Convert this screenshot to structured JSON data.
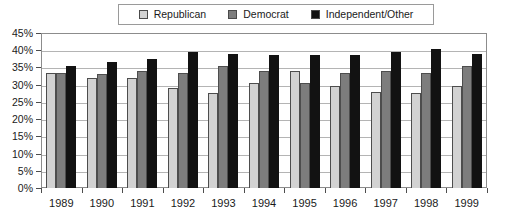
{
  "chart_data": {
    "type": "bar",
    "title": "",
    "xlabel": "",
    "ylabel": "",
    "ylim": [
      0,
      45
    ],
    "ytick_step": 5,
    "grid": true,
    "legend_position": "top-center",
    "yticks": [
      "45%",
      "40%",
      "35%",
      "30%",
      "25%",
      "20%",
      "15%",
      "10%",
      "5%",
      "0%"
    ],
    "categories": [
      "1989",
      "1990",
      "1991",
      "1992",
      "1993",
      "1994",
      "1995",
      "1996",
      "1997",
      "1998",
      "1999"
    ],
    "series": [
      {
        "name": "Republican",
        "color": "#d2d2d2",
        "values": [
          33.5,
          32,
          32,
          29,
          27.5,
          30.5,
          34,
          29.5,
          28,
          27.5,
          29.5
        ]
      },
      {
        "name": "Democrat",
        "color": "#7d7d7d",
        "values": [
          33.5,
          33,
          34,
          33.5,
          35.5,
          34,
          30.5,
          33.5,
          34,
          33.5,
          35.5
        ]
      },
      {
        "name": "Independent/Other",
        "color": "#121212",
        "values": [
          35.5,
          36.5,
          37.5,
          39.5,
          39,
          38.5,
          38.5,
          38.5,
          39.5,
          40.5,
          39
        ]
      }
    ]
  },
  "legend": {
    "items": [
      {
        "label": "Republican",
        "swatch": "#d2d2d2"
      },
      {
        "label": "Democrat",
        "swatch": "#7d7d7d"
      },
      {
        "label": "Independent/Other",
        "swatch": "#121212"
      }
    ]
  }
}
